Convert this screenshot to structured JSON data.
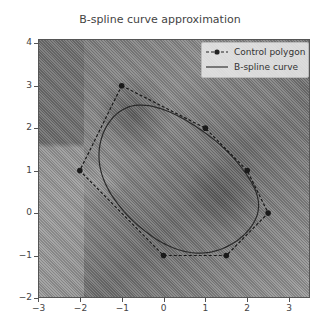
{
  "chart_data": {
    "type": "line",
    "title": "B-spline curve approximation",
    "xlabel": "",
    "ylabel": "",
    "xlim": [
      -3,
      3.5
    ],
    "ylim": [
      -2,
      4.1
    ],
    "x_ticks": [
      -3,
      -2,
      -1,
      0,
      1,
      2,
      3
    ],
    "y_ticks": [
      -2,
      -1,
      0,
      1,
      2,
      3,
      4
    ],
    "grid": false,
    "legend_position": "upper right",
    "background": "grayscale microscopy image",
    "series": [
      {
        "name": "Control polygon",
        "style": "dashed line with circle markers",
        "color": "#222222",
        "points": [
          [
            -1,
            3
          ],
          [
            1,
            2
          ],
          [
            2,
            1
          ],
          [
            2.5,
            0
          ],
          [
            1.5,
            -1
          ],
          [
            0,
            -1
          ],
          [
            -2,
            1
          ],
          [
            -1,
            3
          ]
        ]
      },
      {
        "name": "B-spline curve",
        "style": "solid line",
        "color": "#333333",
        "derived_from": "Control polygon",
        "closed": true
      }
    ]
  },
  "title": "B-spline curve approximation",
  "legend": {
    "items": [
      {
        "label": "Control polygon"
      },
      {
        "label": "B-spline curve"
      }
    ]
  },
  "axes": {
    "x_tick_labels": [
      "−3",
      "−2",
      "−1",
      "0",
      "1",
      "2",
      "3"
    ],
    "y_tick_labels": [
      "−2",
      "−1",
      "0",
      "1",
      "2",
      "3",
      "4"
    ]
  }
}
